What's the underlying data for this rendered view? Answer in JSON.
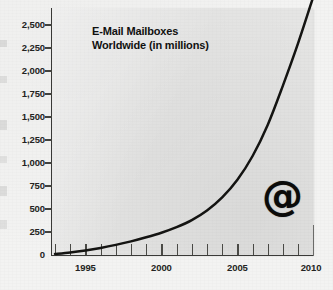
{
  "chart_data": {
    "type": "line",
    "title_line1": "E-Mail Mailboxes",
    "title_line2": "Worldwide (in millions)",
    "xlabel": "",
    "ylabel": "",
    "ylim": [
      0,
      2500
    ],
    "xlim": [
      1993,
      2010
    ],
    "grid": false,
    "legend": null,
    "annotations": [
      "@"
    ],
    "y_ticks": [
      0,
      250,
      500,
      750,
      1000,
      1250,
      1500,
      1750,
      2000,
      2250,
      2500
    ],
    "y_tick_labels": [
      "0",
      "250",
      "500",
      "750",
      "1,000",
      "1,250",
      "1,500",
      "1,750",
      "2,000",
      "2,250",
      "2,500"
    ],
    "x_ticks": [
      1993,
      1994,
      1995,
      1996,
      1997,
      1998,
      1999,
      2000,
      2001,
      2002,
      2003,
      2004,
      2005,
      2006,
      2007,
      2008,
      2009,
      2010
    ],
    "x_tick_labels": [
      "1995",
      "2000",
      "2005",
      "2010"
    ],
    "x_labeled_ticks": [
      1995,
      2000,
      2005,
      2010
    ],
    "series": [
      {
        "name": "E-Mail Mailboxes Worldwide",
        "x": [
          1993,
          1994,
          1995,
          1996,
          1997,
          1998,
          1999,
          2000,
          2001,
          2002,
          2003,
          2004,
          2005,
          2006,
          2007,
          2008,
          2009,
          2010
        ],
        "values": [
          10,
          25,
          45,
          70,
          100,
          135,
          175,
          220,
          275,
          345,
          440,
          570,
          745,
          980,
          1290,
          1680,
          2100,
          2560
        ]
      }
    ],
    "colors": {
      "curve": "#141412",
      "plot_background": "#e5e5e4",
      "figure_background": "#f3f3f2",
      "axis": "#3a3a38",
      "text": "#242422"
    }
  },
  "at_symbol": "@"
}
